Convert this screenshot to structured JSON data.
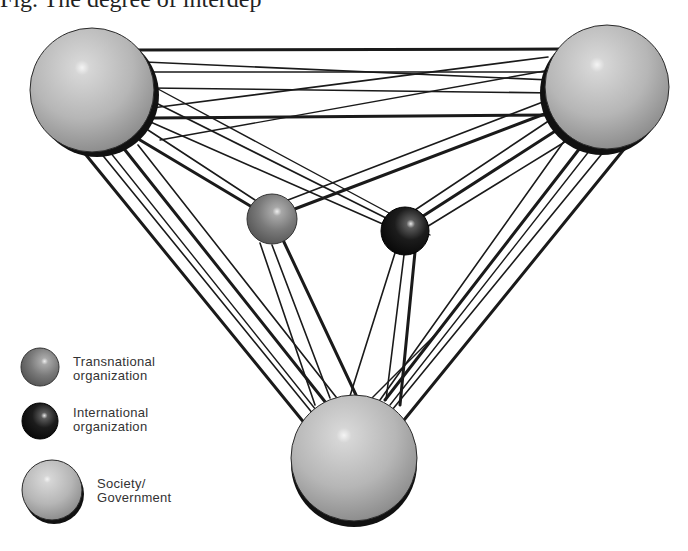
{
  "figure": {
    "title_partial": "Fig. The degree of interdep"
  },
  "nodes": [
    {
      "id": "society-top-left",
      "type": "Society/Government",
      "cx": 92,
      "cy": 90,
      "r": 62
    },
    {
      "id": "society-top-right",
      "type": "Society/Government",
      "cx": 607,
      "cy": 87,
      "r": 62
    },
    {
      "id": "society-bottom",
      "type": "Society/Government",
      "cx": 354,
      "cy": 458,
      "r": 63
    },
    {
      "id": "transnational-org",
      "type": "Transnational organization",
      "cx": 272,
      "cy": 219,
      "r": 25
    },
    {
      "id": "international-org",
      "type": "International organization",
      "cx": 405,
      "cy": 231,
      "r": 24
    }
  ],
  "legend": {
    "items": [
      {
        "label_line1": "Transnational",
        "label_line2": "organization",
        "color": "#6e6e6e"
      },
      {
        "label_line1": "International",
        "label_line2": "organization",
        "color": "#151515"
      },
      {
        "label_line1": "Society/",
        "label_line2": "Government",
        "color": "#b5b5b5"
      }
    ]
  },
  "colors": {
    "line": "#1a1a1a",
    "society_fill": "#b8b8b8",
    "transnational_fill": "#727272",
    "international_fill": "#141414"
  }
}
